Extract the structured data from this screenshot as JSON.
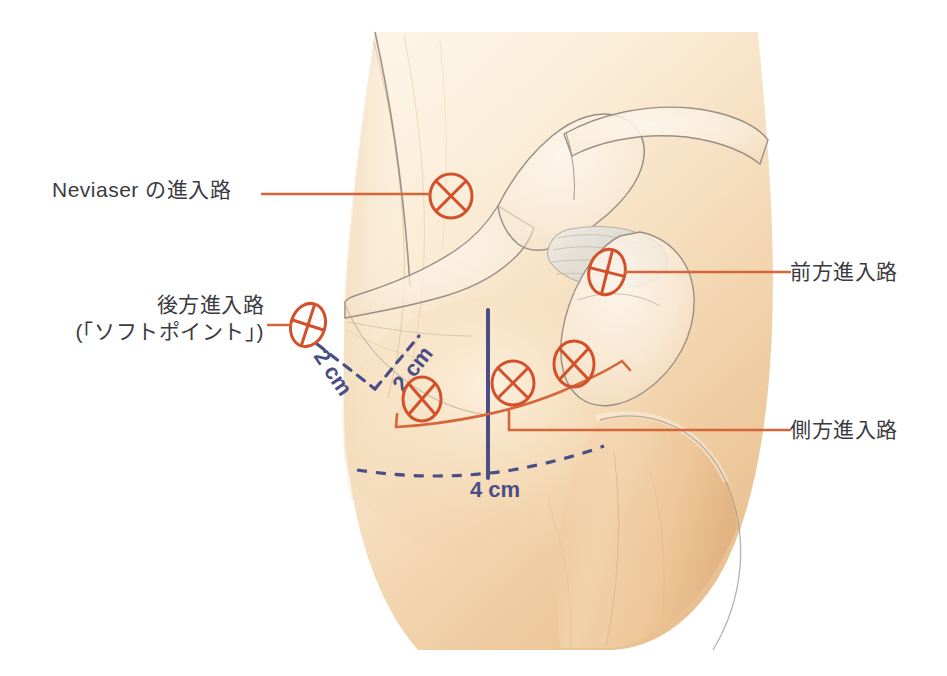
{
  "figure": {
    "view": "右肩 後外側からの図",
    "colors": {
      "marker": "#d4502a",
      "leader": "#d4663a",
      "measure": "#4a4e86",
      "bone_outline": "#9a8f86",
      "skin_light": "#fbf0dd",
      "skin_mid": "#f3d6ab",
      "skin_deep": "#e8bd8e",
      "label_text": "#3b3b3f",
      "background": "#ffffff"
    }
  },
  "labels": {
    "neviaser": "Neviaser の進入路",
    "posterior_line1": "後方進入路",
    "posterior_line2": "(「ソフトポイント」)",
    "anterior": "前方進入路",
    "lateral": "側方進入路"
  },
  "measurements": [
    {
      "id": "m-2cm-left",
      "text": "2 cm",
      "style": "dashed",
      "color": "#4a4e86"
    },
    {
      "id": "m-2cm-right",
      "text": "2 cm",
      "style": "dashed",
      "color": "#4a4e86"
    },
    {
      "id": "m-4cm",
      "text": "4 cm",
      "style": "solid",
      "color": "#4a4e86"
    }
  ],
  "portals": [
    {
      "id": "portal-neviaser",
      "label": "Neviaser の進入路",
      "cx": 451,
      "cy": 196,
      "rx": 21,
      "ry": 22,
      "rot": 0
    },
    {
      "id": "portal-posterior",
      "label": "後方進入路",
      "cx": 308,
      "cy": 325,
      "rx": 17,
      "ry": 22,
      "rot": 18
    },
    {
      "id": "portal-anterior",
      "label": "前方進入路",
      "cx": 607,
      "cy": 272,
      "rx": 18,
      "ry": 23,
      "rot": 14
    },
    {
      "id": "portal-lateral-1",
      "label": "側方進入路",
      "cx": 422,
      "cy": 399,
      "rx": 19,
      "ry": 22,
      "rot": 10
    },
    {
      "id": "portal-lateral-2",
      "label": "側方進入路",
      "cx": 513,
      "cy": 383,
      "rx": 21,
      "ry": 22,
      "rot": 0
    },
    {
      "id": "portal-lateral-3",
      "label": "側方進入路",
      "cx": 574,
      "cy": 364,
      "rx": 20,
      "ry": 23,
      "rot": 12
    }
  ]
}
